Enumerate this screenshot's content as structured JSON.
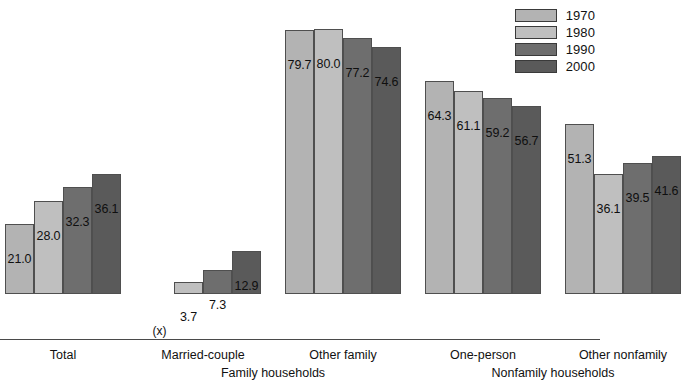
{
  "chart_data": {
    "type": "bar",
    "title": "",
    "subtitle": "",
    "xlabel": "",
    "ylabel": "",
    "ylim": [
      0,
      85
    ],
    "grid": false,
    "legend_position": "top-right",
    "categories": [
      "Total",
      "Married-couple",
      "Other family",
      "One-person",
      "Other nonfamily"
    ],
    "group_labels": [
      "Family households",
      "Nonfamily households"
    ],
    "group_spans": [
      [
        1,
        2
      ],
      [
        3,
        4
      ]
    ],
    "series": [
      {
        "name": "1970",
        "color": "#b3b3b3",
        "values": [
          21.0,
          null,
          79.7,
          64.3,
          51.3
        ],
        "labels": [
          "21.0",
          "(x)",
          "79.7",
          "64.3",
          "51.3"
        ]
      },
      {
        "name": "1980",
        "color": "#bfbfbf",
        "values": [
          28.0,
          3.7,
          80.0,
          61.1,
          36.1
        ],
        "labels": [
          "28.0",
          "3.7",
          "80.0",
          "61.1",
          "36.1"
        ]
      },
      {
        "name": "1990",
        "color": "#6e6e6e",
        "values": [
          32.3,
          7.3,
          77.2,
          59.2,
          39.5
        ],
        "labels": [
          "32.3",
          "7.3",
          "77.2",
          "59.2",
          "39.5"
        ]
      },
      {
        "name": "2000",
        "color": "#5a5a5a",
        "values": [
          36.1,
          12.9,
          74.6,
          56.7,
          41.6
        ],
        "labels": [
          "36.1",
          "12.9",
          "74.6",
          "56.7",
          "41.6"
        ]
      }
    ],
    "notes": {
      "na_marker": "(x)"
    }
  },
  "legend": {
    "items": [
      {
        "label": "1970",
        "color": "#b3b3b3"
      },
      {
        "label": "1980",
        "color": "#bfbfbf"
      },
      {
        "label": "1990",
        "color": "#6e6e6e"
      },
      {
        "label": "2000",
        "color": "#5a5a5a"
      }
    ]
  },
  "axis": {
    "categories": [
      {
        "label": "Total"
      },
      {
        "label": "Married-couple"
      },
      {
        "label": "Other family"
      },
      {
        "label": "One-person"
      },
      {
        "label": "Other nonfamily"
      }
    ],
    "super_categories": [
      {
        "label": "Family households"
      },
      {
        "label": "Nonfamily households"
      }
    ]
  }
}
